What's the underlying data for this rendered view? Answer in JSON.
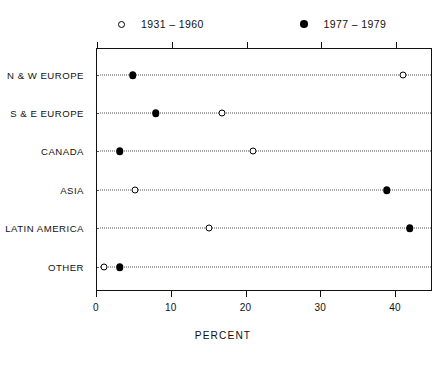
{
  "chart_data": {
    "type": "scatter",
    "title": "",
    "subtitle": "",
    "xlabel": "PERCENT",
    "ylabel": "",
    "xlim": [
      0,
      45
    ],
    "xticks": [
      0,
      10,
      20,
      30,
      40
    ],
    "xticklabels": [
      "0",
      "10",
      "20",
      "30",
      "40"
    ],
    "grid": "horizontal dotted rows per category",
    "legend_position": "top",
    "categories": [
      "N & W EUROPE",
      "S & E EUROPE",
      "CANADA",
      "ASIA",
      "LATIN AMERICA",
      "OTHER"
    ],
    "series": [
      {
        "name": "1931 – 1960",
        "marker": "open-circle",
        "color": "#000000",
        "values": [
          41.1,
          16.9,
          21.0,
          5.2,
          15.1,
          1.1
        ]
      },
      {
        "name": "1977 – 1979",
        "marker": "filled-circle",
        "color": "#000000",
        "values": [
          4.9,
          8.0,
          3.2,
          38.9,
          42.0,
          3.2
        ]
      }
    ]
  },
  "legend": {
    "entries": [
      {
        "marker": "open-circle-marker",
        "label": "1931 – 1960"
      },
      {
        "marker": "filled-circle-marker",
        "label": "1977 – 1979"
      }
    ]
  },
  "axis": {
    "x_title": "PERCENT",
    "tick_labels": [
      "0",
      "10",
      "20",
      "30",
      "40"
    ]
  },
  "y_axis": {
    "labels": [
      "N & W EUROPE",
      "S & E EUROPE",
      "CANADA",
      "ASIA",
      "LATIN AMERICA",
      "OTHER"
    ]
  }
}
